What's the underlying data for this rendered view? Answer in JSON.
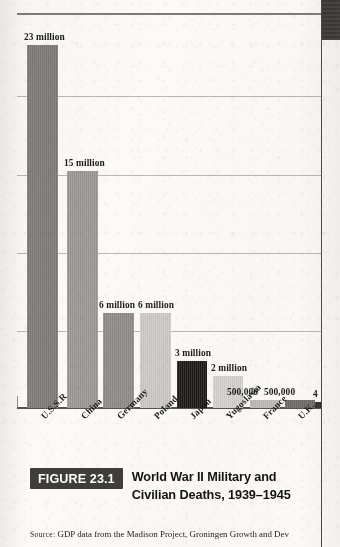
{
  "figure": {
    "badge_label": "FIGURE 23.1",
    "caption": "World War II Military and Civilian Deaths, 1939–1945",
    "source_prefix": "Source:",
    "source_text": " GDP data from the Madison Project, Groningen Growth and Dev"
  },
  "chart_data": {
    "type": "bar",
    "title": "World War II Military and Civilian Deaths, 1939–1945",
    "xlabel": "",
    "ylabel": "",
    "ylim": [
      0,
      25
    ],
    "y_unit": "millions of deaths",
    "grid": true,
    "gridline_values": [
      25,
      20,
      15,
      10,
      5
    ],
    "legend": "none",
    "categories": [
      "U.S.S.R",
      "China",
      "Germany",
      "Poland",
      "Japan",
      "Yugoslavia",
      "France",
      "U.K.",
      ""
    ],
    "values": [
      23,
      15,
      6,
      6,
      3,
      2,
      0.5,
      0.5,
      0.4
    ],
    "value_labels": [
      "23 million",
      "15 million",
      "6 million",
      "6 million",
      "3 million",
      "2 million",
      "500,000",
      "500,000",
      "4"
    ],
    "bar_colors": [
      "#7d7b78",
      "#9a9895",
      "#8e8c88",
      "#cdcbc7",
      "#1c1b19",
      "#d6d4d0",
      "#bebcb8",
      "#6e6c68",
      "#2a2927"
    ],
    "note_last_bar_cut_off": true
  },
  "colors": {
    "axis": "#56544f",
    "gridline": "#b9b7b2",
    "badge_bg": "#403e3a",
    "badge_fg": "#ffffff",
    "page_edge": "#4b4a47",
    "text": "#1b1a18",
    "paper": "#fbfaf7"
  }
}
